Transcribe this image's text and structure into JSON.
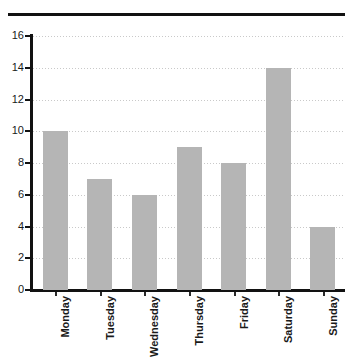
{
  "figure": {
    "title_partial": "Jelly",
    "title_note": "cut-off-title-descender"
  },
  "chart_data": {
    "type": "bar",
    "title": "",
    "xlabel": "",
    "ylabel": "",
    "categories": [
      "Monday",
      "Tuesday",
      "Wednesday",
      "Thursday",
      "Friday",
      "Saturday",
      "Sunday"
    ],
    "values": [
      10,
      7,
      6,
      9,
      8,
      14,
      4
    ],
    "ylim": [
      0,
      16
    ],
    "ytick_labels": [
      "0",
      "2",
      "4",
      "6",
      "8",
      "10",
      "12",
      "14",
      "16"
    ],
    "ytick_values": [
      0,
      2,
      4,
      6,
      8,
      10,
      12,
      14,
      16
    ],
    "grid": true,
    "grid_axis": "y",
    "grid_style": "dotted",
    "legend": "none",
    "bar_color": "#b5b5b5",
    "axis_color": "#121212",
    "grid_color": "#c9c9c9",
    "xtick_rotation": 90
  }
}
